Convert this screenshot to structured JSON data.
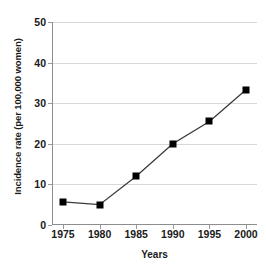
{
  "chart_data": {
    "type": "line",
    "title": "",
    "subtitle": "",
    "xlabel": "Years",
    "ylabel": "Incidence rate (per 100,000 women)",
    "x": [
      1975,
      1980,
      1985,
      1990,
      1995,
      2000
    ],
    "categories": [
      "1975",
      "1980",
      "1985",
      "1990",
      "1995",
      "2000"
    ],
    "values": [
      5.7,
      5.0,
      12.0,
      20.0,
      25.5,
      33.3
    ],
    "series": [
      {
        "name": "Incidence rate",
        "values": [
          5.7,
          5.0,
          12.0,
          20.0,
          25.5,
          33.3
        ],
        "marker": "filled-square",
        "marker_color": "#000000",
        "line_color": "#3a3a3a"
      }
    ],
    "xlim": [
      1973.5,
      2001.5
    ],
    "ylim": [
      0,
      50
    ],
    "yticks": [
      0,
      10,
      20,
      30,
      40,
      50
    ],
    "ytick_labels": [
      "0",
      "10",
      "20",
      "30",
      "40",
      "50"
    ],
    "xticks": [
      1975,
      1980,
      1985,
      1990,
      1995,
      2000
    ],
    "xtick_labels": [
      "1975",
      "1980",
      "1985",
      "1990",
      "1995",
      "2000"
    ],
    "grid": "horizontal",
    "grid_color": "#d8d8d8",
    "axis_color": "#8d8d8d",
    "legend": "none",
    "background": "#ffffff"
  }
}
